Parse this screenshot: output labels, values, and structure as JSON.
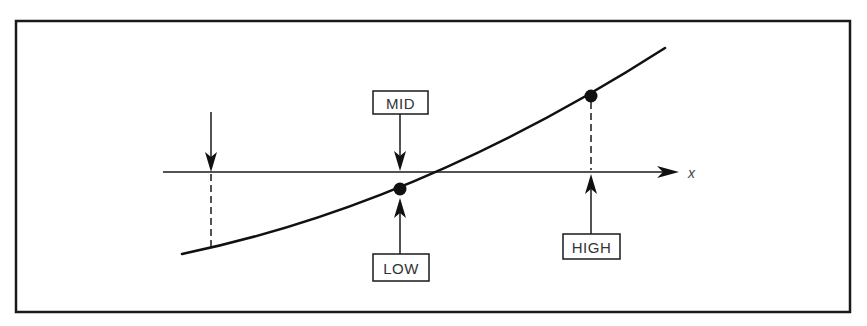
{
  "figure": {
    "caption_fragment": "",
    "frame": {
      "x": 16,
      "y": 21,
      "width": 834,
      "height": 291
    },
    "axis": {
      "label": "x",
      "y": 172,
      "x_start": 163,
      "x_end": 679,
      "label_x": 688
    },
    "curve": {
      "description": "monotonically increasing smooth curve crossing the x-axis between LOW and HIGH",
      "start": [
        182,
        254
      ],
      "control": [
        420,
        205
      ],
      "end": [
        665,
        48
      ]
    },
    "markers": {
      "left_guess": {
        "x": 211,
        "arrow_top_y": 112,
        "axis_y": 172,
        "curve_y": 249
      },
      "mid": {
        "label": "MID",
        "x": 400,
        "box": {
          "x": 373,
          "y": 91,
          "width": 55,
          "height": 23
        },
        "arrow_tip_y": 171
      },
      "low": {
        "label": "LOW",
        "x": 400,
        "dot_y": 189,
        "box": {
          "x": 373,
          "y": 254,
          "width": 56,
          "height": 27
        },
        "arrow_tip_y": 198
      },
      "high": {
        "label": "HIGH",
        "x": 591,
        "dot_y": 96,
        "box": {
          "x": 563,
          "y": 234,
          "width": 57,
          "height": 25
        },
        "arrow_tip_y": 174
      }
    },
    "colors": {
      "ink": "#111111",
      "label_text": "#333333",
      "background": "#ffffff"
    }
  }
}
